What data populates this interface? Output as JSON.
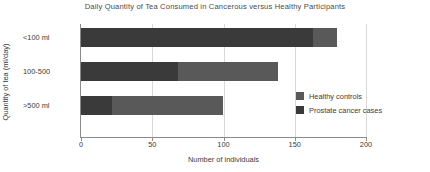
{
  "chart_data": {
    "type": "bar",
    "orientation": "horizontal",
    "stacked": true,
    "title": "Daily Quantity of Tea Consumed in Cancerous versus Healthy Participants",
    "xlabel": "Number of individuals",
    "ylabel": "Quantity of tea (ml/day)",
    "categories": [
      "<100 ml",
      "100-500",
      ">500 ml"
    ],
    "series": [
      {
        "name": "Prostate cancer cases",
        "color": "#3a3a3a",
        "values": [
          163,
          68,
          22
        ]
      },
      {
        "name": "Healthy controls",
        "color": "#595959",
        "values": [
          17,
          70,
          78
        ]
      }
    ],
    "totals": [
      180,
      138,
      100
    ],
    "xlim": [
      0,
      200
    ],
    "xticks": [
      0,
      50,
      100,
      150,
      200
    ],
    "xtick_labels": [
      "0",
      "50",
      "100",
      "150",
      "200"
    ],
    "grid": true,
    "grid_axis": "x",
    "legend_position": "center-right",
    "legend_entries": [
      {
        "label": "Healthy controls",
        "color": "#595959"
      },
      {
        "label": "Prostate cancer cases",
        "color": "#3a3a3a"
      }
    ],
    "colors": {
      "axis": "#8a8a8a",
      "grid": "#d8d8d8",
      "text": "#3b3b3b",
      "title": "#4a4a4a",
      "background": "#ffffff"
    }
  }
}
